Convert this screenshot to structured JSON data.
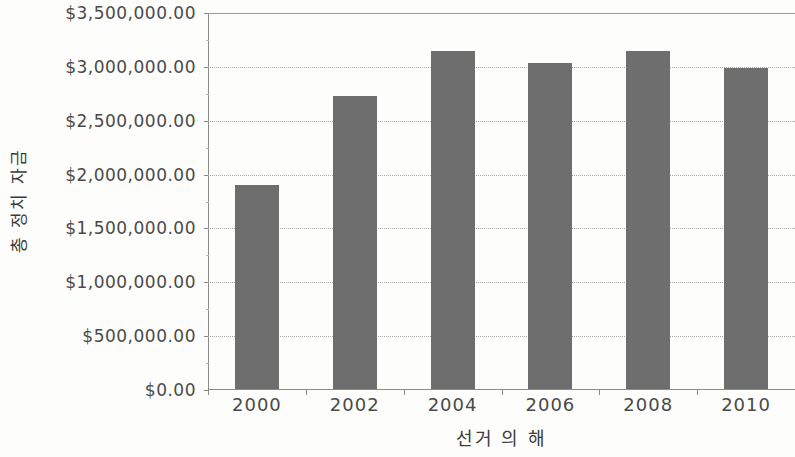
{
  "chart_data": {
    "type": "bar",
    "title": "",
    "xlabel": "선거 의 해",
    "ylabel": "총 정치 자금",
    "categories": [
      "2000",
      "2002",
      "2004",
      "2006",
      "2008",
      "2010"
    ],
    "values": [
      1900000,
      2730000,
      3150000,
      3040000,
      3150000,
      2990000
    ],
    "series": [
      {
        "name": "총 정치 자금",
        "values": [
          1900000,
          2730000,
          3150000,
          3040000,
          3150000,
          2990000
        ]
      }
    ],
    "ylim": [
      0,
      3500000
    ],
    "ytick_values": [
      0,
      500000,
      1000000,
      1500000,
      2000000,
      2500000,
      3000000,
      3500000
    ],
    "ytick_labels": [
      "$0.00",
      "$500,000.00",
      "$1,000,000.00",
      "$1,500,000.00",
      "$2,000,000.00",
      "$2,500,000.00",
      "$3,000,000.00",
      "$3,500,000.00"
    ],
    "xtick_labels": [
      "2000",
      "2002",
      "2004",
      "2006",
      "2008",
      "2010"
    ],
    "grid": true,
    "grid_axis": "y",
    "legend": false,
    "legend_position": "none",
    "bar_color": "#6e6e6e",
    "gridline_color": "#a8a8a8",
    "axis_color": "#8a8a8a",
    "background_color": "#fdfdfb",
    "text_color": "#4a4a4a"
  }
}
